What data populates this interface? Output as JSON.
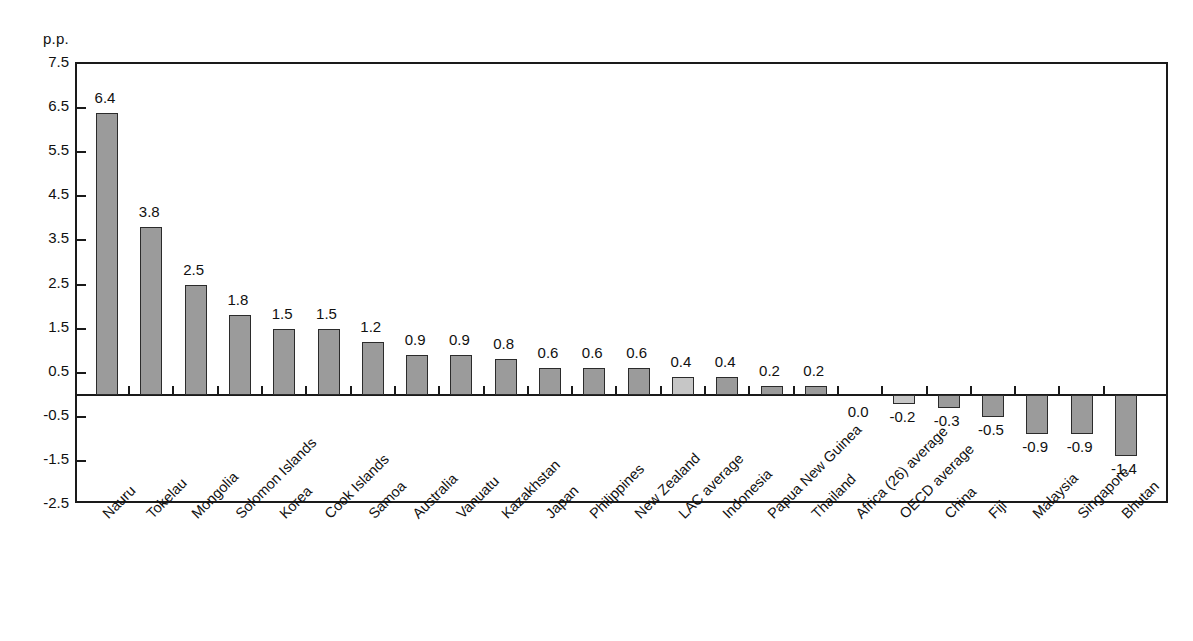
{
  "top_cut_text": "",
  "axis": {
    "unit_label": "p.p.",
    "y_ticks": [
      "7.5",
      "6.5",
      "5.5",
      "4.5",
      "3.5",
      "2.5",
      "1.5",
      "0.5",
      "-0.5",
      "-1.5",
      "-2.5"
    ]
  },
  "colors": {
    "bar_fill": "#9b9b9b",
    "bar_fill_light": "#c6c6c6",
    "bar_stroke": "#2b2b2b",
    "axis": "#1a1a1a",
    "text": "#111111",
    "background": "#ffffff"
  },
  "chart_data": {
    "type": "bar",
    "title": "",
    "xlabel": "",
    "ylabel": "p.p.",
    "ylim": [
      -2.5,
      7.5
    ],
    "ytick_step": 1.0,
    "grid": false,
    "legend": "none",
    "categories": [
      "Nauru",
      "Tokelau",
      "Mongolia",
      "Solomon Islands",
      "Korea",
      "Cook Islands",
      "Samoa",
      "Australia",
      "Vanuatu",
      "Kazakhstan",
      "Japan",
      "Philippines",
      "New Zealand",
      "LAC average",
      "Indonesia",
      "Papua New Guinea",
      "Thailand",
      "Africa (26) average",
      "OECD average",
      "China",
      "Fiji",
      "Malaysia",
      "Singapore",
      "Bhutan"
    ],
    "values": [
      6.4,
      3.8,
      2.5,
      1.8,
      1.5,
      1.5,
      1.2,
      0.9,
      0.9,
      0.8,
      0.6,
      0.6,
      0.6,
      0.4,
      0.4,
      0.2,
      0.2,
      0.0,
      -0.2,
      -0.3,
      -0.5,
      -0.9,
      -0.9,
      -1.4
    ],
    "labels": [
      "6.4",
      "3.8",
      "2.5",
      "1.8",
      "1.5",
      "1.5",
      "1.2",
      "0.9",
      "0.9",
      "0.8",
      "0.6",
      "0.6",
      "0.6",
      "0.4",
      "0.4",
      "0.2",
      "0.2",
      "0.0",
      "-0.2",
      "-0.3",
      "-0.5",
      "-0.9",
      "-0.9",
      "-1.4"
    ],
    "highlight_indices": [
      13,
      17,
      18
    ]
  }
}
